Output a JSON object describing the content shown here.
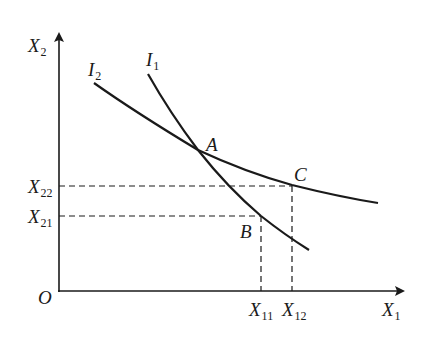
{
  "diagram": {
    "type": "indifference-curves",
    "axes": {
      "origin": "O",
      "x_axis": {
        "base": "X",
        "sub": "1"
      },
      "y_axis": {
        "base": "X",
        "sub": "2"
      }
    },
    "curves": [
      {
        "id": "I1",
        "base": "I",
        "sub": "1",
        "description": "steeper curve through A and B"
      },
      {
        "id": "I2",
        "base": "I",
        "sub": "2",
        "description": "flatter curve through A and C"
      }
    ],
    "points": [
      {
        "id": "A",
        "label": "A",
        "on": [
          "I1",
          "I2"
        ]
      },
      {
        "id": "B",
        "label": "B",
        "on": [
          "I1"
        ],
        "x": "X11",
        "y": "X21"
      },
      {
        "id": "C",
        "label": "C",
        "on": [
          "I2"
        ],
        "x": "X12",
        "y": "X22"
      }
    ],
    "tick_labels": {
      "x": [
        {
          "base": "X",
          "sub": "11"
        },
        {
          "base": "X",
          "sub": "12"
        }
      ],
      "y": [
        {
          "base": "X",
          "sub": "22"
        },
        {
          "base": "X",
          "sub": "21"
        }
      ]
    },
    "colors": {
      "line": "#1a1a1a",
      "background": "#ffffff"
    }
  }
}
